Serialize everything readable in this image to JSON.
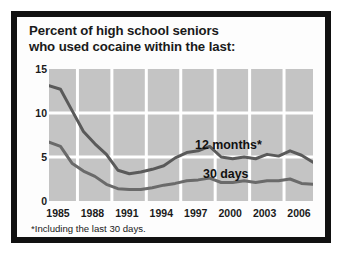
{
  "chart_data": {
    "type": "line",
    "title": "Percent of high school seniors who used cocaine within the last:",
    "title_line1": "Percent of high school seniors",
    "title_line2": "who used cocaine within the last:",
    "xlabel": "",
    "ylabel": "",
    "xlim": [
      1985,
      2008
    ],
    "ylim": [
      0,
      15
    ],
    "yticks": [
      "15",
      "10",
      "5",
      "0"
    ],
    "ytick_values": [
      15,
      10,
      5,
      0
    ],
    "xticks": [
      "1985",
      "1988",
      "1991",
      "1994",
      "1997",
      "2000",
      "2003",
      "2006"
    ],
    "xtick_values": [
      1985,
      1988,
      1991,
      1994,
      1997,
      2000,
      2003,
      2006
    ],
    "grid": true,
    "legend_position": "inline-annotation",
    "annotations": [
      "12 months*",
      "30 days"
    ],
    "footnote": "*Including the last 30 days.",
    "x": [
      1985,
      1986,
      1987,
      1988,
      1989,
      1990,
      1991,
      1992,
      1993,
      1994,
      1995,
      1996,
      1997,
      1998,
      1999,
      2000,
      2001,
      2002,
      2003,
      2004,
      2005,
      2006,
      2007,
      2008
    ],
    "series": [
      {
        "name": "12 months*",
        "color": "#5a5a5a",
        "values": [
          13.1,
          12.7,
          10.3,
          7.9,
          6.5,
          5.3,
          3.5,
          3.1,
          3.3,
          3.6,
          4.0,
          4.9,
          5.5,
          5.7,
          6.2,
          5.0,
          4.8,
          5.0,
          4.8,
          5.3,
          5.1,
          5.7,
          5.2,
          4.4
        ]
      },
      {
        "name": "30 days",
        "color": "#6a6a6a",
        "values": [
          6.7,
          6.2,
          4.3,
          3.4,
          2.8,
          1.9,
          1.4,
          1.3,
          1.3,
          1.5,
          1.8,
          2.0,
          2.3,
          2.4,
          2.6,
          2.1,
          2.1,
          2.3,
          2.1,
          2.3,
          2.3,
          2.5,
          2.0,
          1.9
        ]
      }
    ],
    "style": {
      "plot_background": "#c4c4c4",
      "gridline_color": "#ffffff",
      "border_color": "#111111",
      "page_background": "#ffffff",
      "text_color": "#1a1a1a"
    }
  }
}
